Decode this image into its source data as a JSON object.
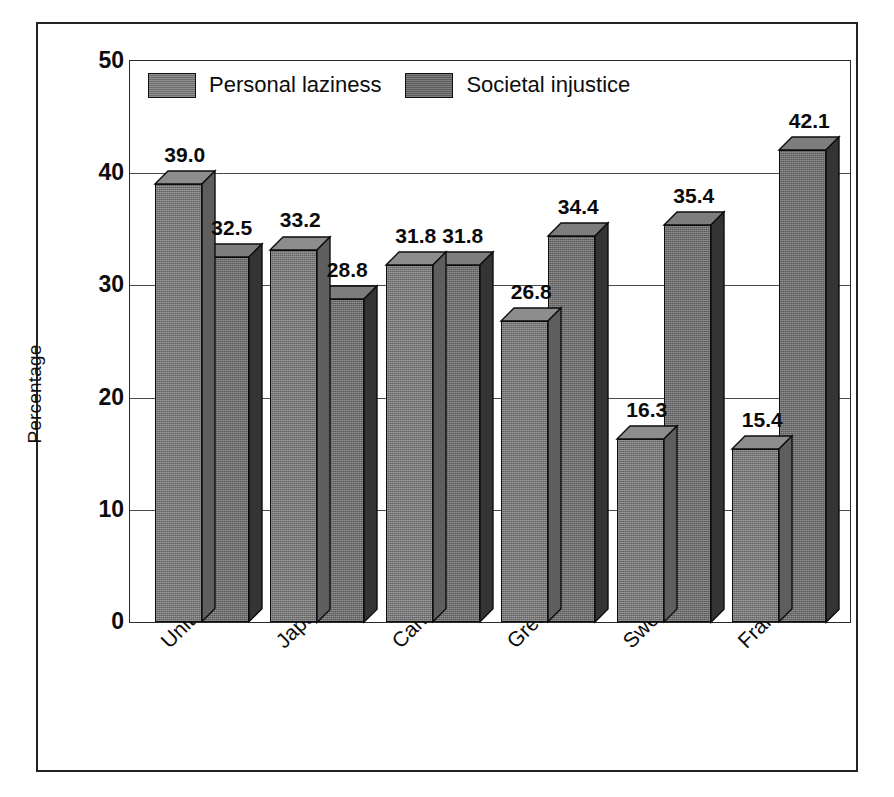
{
  "chart_data": {
    "type": "bar",
    "title": "",
    "subtitle": "",
    "xlabel": "",
    "ylabel": "Percentage",
    "ylim": [
      0,
      50
    ],
    "y_ticks": [
      50,
      40,
      30,
      20,
      10,
      0
    ],
    "grid": true,
    "legend_position": "top-center",
    "style": "3d-clustered-column",
    "categories": [
      "United States",
      "Japan",
      "Canada",
      "Great Britain",
      "Sweden",
      "France"
    ],
    "series": [
      {
        "name": "Personal laziness",
        "color": "#807f80",
        "values": [
          39.0,
          33.2,
          31.8,
          26.8,
          16.3,
          15.4
        ],
        "labels": [
          "39.0",
          "33.2",
          "31.8",
          "26.8",
          "16.3",
          "15.4"
        ]
      },
      {
        "name": "Societal injustice",
        "color": "#767676",
        "values": [
          32.5,
          28.8,
          31.8,
          34.4,
          35.4,
          42.1
        ],
        "labels": [
          "32.5",
          "28.8",
          "31.8",
          "34.4",
          "35.4",
          "42.1"
        ]
      }
    ]
  },
  "colors": {
    "series_light": "#807f80",
    "series_dark": "#767676",
    "side_light": "#5e5e5e",
    "side_dark": "#343434",
    "top_light": "#8d8d8d",
    "top_dark": "#7d7d7d",
    "outline": "#0d0d0d",
    "frame": "#242424",
    "gridline": "#4a4a4a",
    "background": "#ffffff"
  }
}
